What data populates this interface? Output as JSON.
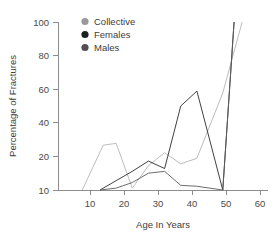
{
  "chart_data": {
    "type": "line",
    "title": "",
    "xlabel": "Age In Years",
    "ylabel": "Percentage of Fractures",
    "xlim": [
      0,
      65
    ],
    "ylim": [
      10,
      100
    ],
    "xticks": [
      10,
      20,
      30,
      40,
      50,
      60
    ],
    "yticks": [
      10,
      20,
      40,
      60,
      80,
      100
    ],
    "grid": false,
    "legend_position": "top-left-inside",
    "series": [
      {
        "name": "Collective",
        "color": "#b4b4b4",
        "marker": "circle",
        "x": [
          7.5,
          14,
          18,
          23,
          28,
          33,
          38,
          43,
          51,
          57
        ],
        "y": [
          10,
          34,
          35,
          11,
          23,
          30,
          24,
          27,
          62,
          100
        ]
      },
      {
        "name": "Females",
        "color": "#2b2b2b",
        "marker": "circle",
        "x": [
          13,
          18,
          23,
          28,
          33,
          38,
          43,
          51,
          54.5
        ],
        "y": [
          10,
          15,
          20,
          25.5,
          21.5,
          55,
          63,
          10,
          100
        ]
      },
      {
        "name": "Males",
        "color": "#5c5c5c",
        "marker": "circle",
        "x": [
          13,
          18,
          23,
          28,
          33,
          38,
          43,
          51,
          54.5
        ],
        "y": [
          10,
          11,
          14,
          19,
          20,
          12.5,
          12,
          10,
          100
        ]
      }
    ]
  },
  "legend": {
    "entries": [
      {
        "label": "Collective",
        "color": "#9a9a9a"
      },
      {
        "label": "Females",
        "color": "#1f1f1f"
      },
      {
        "label": "Males",
        "color": "#4f4f4f"
      }
    ]
  },
  "axes": {
    "x_title": "Age In Years",
    "y_title": "Percentage of Fractures",
    "x_tick_labels": [
      "10",
      "20",
      "30",
      "40",
      "50",
      "60"
    ],
    "y_tick_labels": [
      "10",
      "20",
      "40",
      "60",
      "80",
      "100"
    ]
  }
}
